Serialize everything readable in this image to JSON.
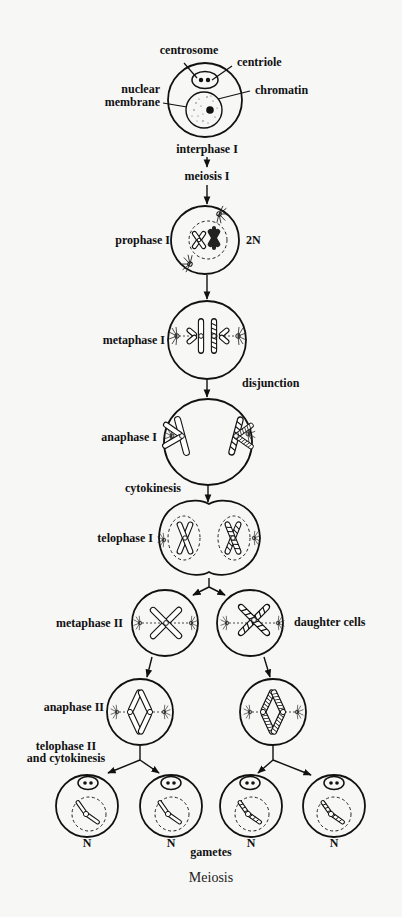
{
  "diagram": {
    "title": "Meiosis",
    "interphase_labels": {
      "centrosome": "centrosome",
      "centriole": "centriole",
      "nuclear_membrane_line1": "nuclear",
      "nuclear_membrane_line2": "membrane",
      "chromatin": "chromatin"
    },
    "stages": {
      "interphase": "interphase I",
      "meiosis": "meiosis I",
      "prophase": "prophase I",
      "ploidy_diploid": "2N",
      "metaphase1": "metaphase I",
      "disjunction": "disjunction",
      "anaphase1": "anaphase I",
      "cytokinesis": "cytokinesis",
      "telophase1": "telophase I",
      "metaphase2": "metaphase II",
      "daughter_cells": "daughter cells",
      "anaphase2": "anaphase II",
      "telophase2_line1": "telophase II",
      "telophase2_line2": "and cytokinesis",
      "gametes": "gametes"
    },
    "gametes": [
      {
        "ploidy": "N"
      },
      {
        "ploidy": "N"
      },
      {
        "ploidy": "N"
      },
      {
        "ploidy": "N"
      }
    ],
    "colors": {
      "background": "#f7f7f6",
      "ink": "#111111"
    }
  }
}
